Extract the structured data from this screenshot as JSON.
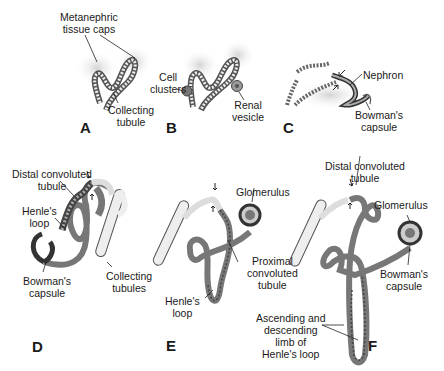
{
  "diagram": {
    "panels": [
      {
        "id": "A",
        "letter": "A",
        "labels": {
          "caps": "Metanephric tissue caps",
          "collecting": "Collecting tubule"
        }
      },
      {
        "id": "B",
        "letter": "B",
        "labels": {
          "cells": "Cell clusters",
          "vesicle": "Renal vesicle"
        }
      },
      {
        "id": "C",
        "letter": "C",
        "labels": {
          "nephron": "Nephron",
          "bowman": "Bowman's capsule"
        }
      },
      {
        "id": "D",
        "letter": "D",
        "labels": {
          "distal": "Distal convoluted tubule",
          "henle": "Henle's loop",
          "bowman": "Bowman's capsule",
          "collecting": "Collecting tubules"
        }
      },
      {
        "id": "E",
        "letter": "E",
        "labels": {
          "glomerulus": "Glomerulus",
          "proximal": "Proximal convoluted tubule",
          "henle": "Henle's loop"
        }
      },
      {
        "id": "F",
        "letter": "F",
        "labels": {
          "distal": "Distal convoluted tubule",
          "glomerulus": "Glomerulus",
          "bowman": "Bowman's capsule",
          "limb": "Ascending and descending limb of Henle's loop"
        }
      }
    ]
  },
  "text": {
    "a_caps_1": "Metanephric",
    "a_caps_2": "tissue caps",
    "a_coll_1": "Collecting",
    "a_coll_2": "tubule",
    "a_letter": "A",
    "b_cell_1": "Cell",
    "b_cell_2": "clusters",
    "b_ves_1": "Renal",
    "b_ves_2": "vesicle",
    "b_letter": "B",
    "c_nephron": "Nephron",
    "c_bow_1": "Bowman's",
    "c_bow_2": "capsule",
    "c_letter": "C",
    "d_dist_1": "Distal convoluted",
    "d_dist_2": "tubule",
    "d_hen_1": "Henle's",
    "d_hen_2": "loop",
    "d_bow_1": "Bowman's",
    "d_bow_2": "capsule",
    "d_coll_1": "Collecting",
    "d_coll_2": "tubules",
    "d_letter": "D",
    "e_glom": "Glomerulus",
    "e_prox_1": "Proximal",
    "e_prox_2": "convoluted",
    "e_prox_3": "tubule",
    "e_hen_1": "Henle's",
    "e_hen_2": "loop",
    "e_letter": "E",
    "f_dist_1": "Distal convoluted",
    "f_dist_2": "tubule",
    "f_glom": "Glomerulus",
    "f_bow_1": "Bowman's",
    "f_bow_2": "capsule",
    "f_limb_1": "Ascending and",
    "f_limb_2": "descending",
    "f_limb_3": "limb of",
    "f_limb_4": "Henle's loop",
    "f_letter": "F"
  },
  "colors": {
    "tubule_dark": "#555555",
    "tubule_mid": "#9a9a9a",
    "tubule_light": "#e6e6e6",
    "tissue": "#d8d8d8",
    "line": "#222222"
  }
}
